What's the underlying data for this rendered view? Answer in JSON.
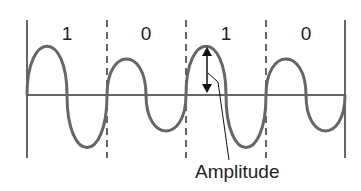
{
  "diagram": {
    "title": "",
    "bits": [
      {
        "label": "1",
        "amplitude": "high"
      },
      {
        "label": "0",
        "amplitude": "low"
      },
      {
        "label": "1",
        "amplitude": "high"
      },
      {
        "label": "0",
        "amplitude": "low"
      }
    ],
    "annotation": "Amplitude",
    "colors": {
      "wave": "#666666",
      "axis": "#333333",
      "divider": "#333333",
      "text": "#222222"
    }
  }
}
